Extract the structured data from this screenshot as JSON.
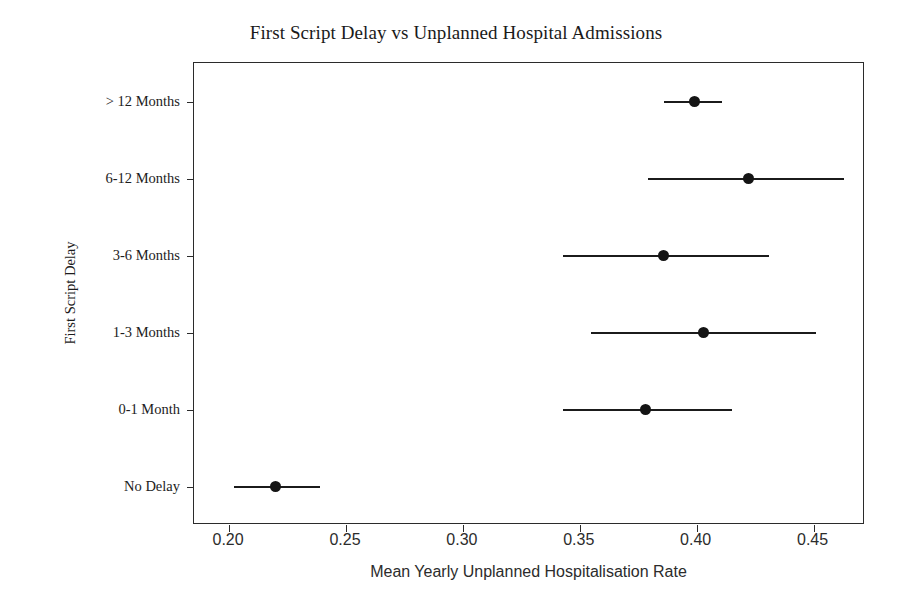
{
  "chart_data": {
    "type": "scatter",
    "title": "First Script Delay vs Unplanned Hospital Admissions",
    "xlabel": "Mean Yearly Unplanned Hospitalisation Rate",
    "ylabel": "First Script Delay",
    "orientation": "horizontal",
    "grid": false,
    "legend": null,
    "xlim": [
      0.185,
      0.472
    ],
    "xticks": [
      0.2,
      0.25,
      0.3,
      0.35,
      0.4,
      0.45
    ],
    "xtick_labels": [
      "0.20",
      "0.25",
      "0.30",
      "0.35",
      "0.40",
      "0.45"
    ],
    "categories": [
      "> 12 Months",
      "6-12 Months",
      "3-6 Months",
      "1-3 Months",
      "0-1 Month",
      "No Delay"
    ],
    "series": [
      {
        "name": "Mean Yearly Unplanned Hospitalisation Rate",
        "marker": "circle",
        "color": "#141414",
        "error_bars": true,
        "points": [
          {
            "category": "> 12 Months",
            "value": 0.399,
            "ci_low": 0.386,
            "ci_high": 0.411
          },
          {
            "category": "6-12 Months",
            "value": 0.422,
            "ci_low": 0.379,
            "ci_high": 0.463
          },
          {
            "category": "3-6 Months",
            "value": 0.386,
            "ci_low": 0.343,
            "ci_high": 0.431
          },
          {
            "category": "1-3 Months",
            "value": 0.403,
            "ci_low": 0.355,
            "ci_high": 0.451
          },
          {
            "category": "0-1 Month",
            "value": 0.378,
            "ci_low": 0.343,
            "ci_high": 0.415
          },
          {
            "category": "No Delay",
            "value": 0.22,
            "ci_low": 0.202,
            "ci_high": 0.239
          }
        ]
      }
    ],
    "values": [
      0.399,
      0.422,
      0.386,
      0.403,
      0.378,
      0.22
    ],
    "colors": {
      "marker": "#141414",
      "error_bar": "#1b1b1b",
      "axis": "#2b2b2b",
      "title_text": "#1a1a1a",
      "background": "#ffffff"
    }
  }
}
